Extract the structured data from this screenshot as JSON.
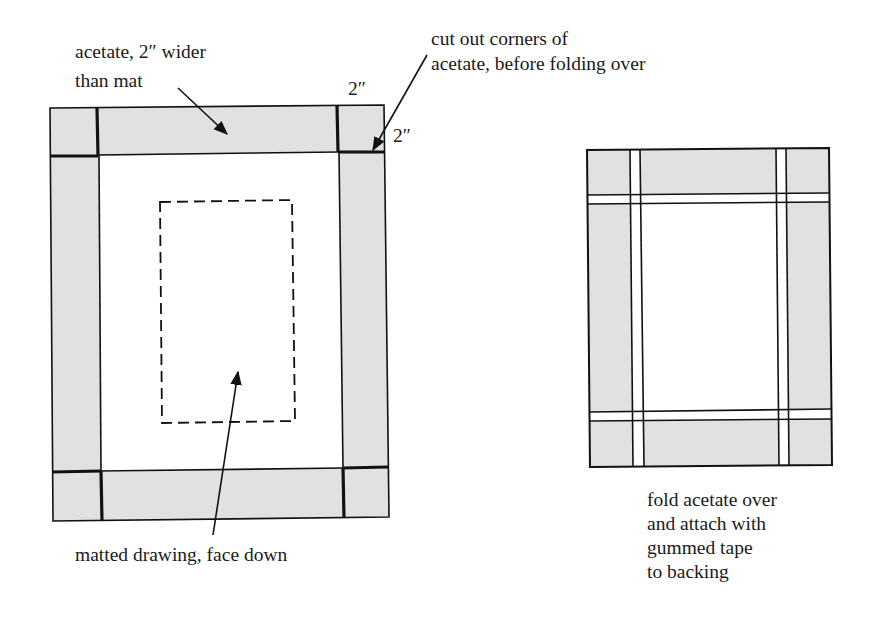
{
  "diagram": {
    "left_figure": {
      "name": "acetate-over-mat",
      "labels": {
        "acetate_line1": "acetate, 2″ wider",
        "acetate_line2": "than mat",
        "cut_line1": "cut out corners of",
        "cut_line2": "acetate, before folding over",
        "dim_top": "2″",
        "dim_side": "2″",
        "drawing": "matted drawing, face down"
      }
    },
    "right_figure": {
      "name": "folded-acetate",
      "labels": {
        "caption_line1": "fold acetate over",
        "caption_line2": "and attach with",
        "caption_line3": "gummed tape",
        "caption_line4": "to backing"
      }
    },
    "colors": {
      "acetate_fill": "#e1e1e1",
      "line": "#111111",
      "background": "#ffffff"
    }
  }
}
